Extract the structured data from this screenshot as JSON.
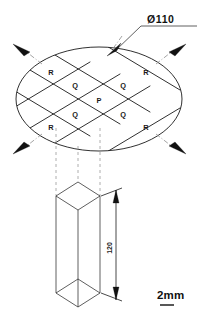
{
  "drawing": {
    "title": "Specimen sampling layout on circular disc",
    "background_color": "#ffffff",
    "line_color": "#1a1a1a",
    "dashed_color": "#9a9a9a",
    "centerline_color": "#8d8d8d"
  },
  "callouts": {
    "diameter": {
      "text": "Ø110",
      "underline": true
    }
  },
  "disc": {
    "shape": "ellipse",
    "center_x": 99,
    "center_y": 99,
    "radius_x": 83,
    "radius_y": 52,
    "grid": {
      "type": "diamond-crosshatch",
      "family_a_angle_deg": 31,
      "family_b_angle_deg": -31
    },
    "region_labels": [
      {
        "text": "R",
        "x": 51,
        "y": 72
      },
      {
        "text": "R",
        "x": 146,
        "y": 72
      },
      {
        "text": "R",
        "x": 51,
        "y": 127
      },
      {
        "text": "R",
        "x": 146,
        "y": 127
      },
      {
        "text": "Q",
        "x": 75,
        "y": 85
      },
      {
        "text": "Q",
        "x": 123,
        "y": 85
      },
      {
        "text": "Q",
        "x": 75,
        "y": 114
      },
      {
        "text": "Q",
        "x": 123,
        "y": 114
      },
      {
        "text": "P",
        "x": 99,
        "y": 100
      }
    ]
  },
  "indicator_arrows": [
    {
      "name": "arrow-top-left",
      "tip_x": 13,
      "tip_y": 45,
      "angle_deg": 208
    },
    {
      "name": "arrow-top-center",
      "tip_x": 107,
      "tip_y": 55,
      "angle_deg": 250
    },
    {
      "name": "arrow-top-right",
      "tip_x": 186,
      "tip_y": 45,
      "angle_deg": 332
    },
    {
      "name": "arrow-bottom-left",
      "tip_x": 13,
      "tip_y": 152,
      "angle_deg": 152
    },
    {
      "name": "arrow-bottom-center",
      "tip_x": 99,
      "tip_y": 156,
      "angle_deg": 110
    },
    {
      "name": "arrow-bottom-right",
      "tip_x": 186,
      "tip_y": 152,
      "angle_deg": 28
    }
  ],
  "prism": {
    "description": "isometric rectangular prism specimen",
    "top_face_center_y": 196,
    "bottom_face_center_y": 293,
    "left_x": 56,
    "right_x": 100,
    "front_x": 78
  },
  "dimension": {
    "value": "120",
    "orientation": "vertical",
    "arrow_style": "double-ended",
    "x": 116,
    "top_y": 192,
    "bottom_y": 297
  },
  "scale_bar": {
    "text": "2mm",
    "x": 158,
    "y": 296,
    "bar_width": 14
  }
}
